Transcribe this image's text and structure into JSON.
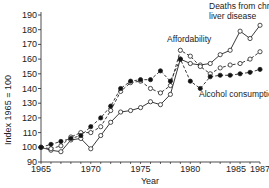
{
  "chart_data": {
    "type": "line",
    "title": "",
    "xlabel": "Year",
    "ylabel": "Index 1965 = 100",
    "xlim": [
      1965,
      1987
    ],
    "ylim": [
      90,
      190
    ],
    "x_ticks": [
      1965,
      1970,
      1975,
      1980,
      1985,
      1987
    ],
    "y_ticks": [
      90,
      100,
      110,
      120,
      130,
      140,
      150,
      160,
      170,
      180,
      190
    ],
    "grid": false,
    "legend_position": "inline annotations",
    "x": [
      1965,
      1966,
      1967,
      1968,
      1969,
      1970,
      1971,
      1972,
      1973,
      1974,
      1975,
      1976,
      1977,
      1978,
      1979,
      1980,
      1981,
      1982,
      1983,
      1984,
      1985,
      1986,
      1987
    ],
    "series": [
      {
        "name": "Deaths from chronic liver disease",
        "marker": "open-circle",
        "line": "solid",
        "values": [
          100,
          98,
          97,
          105,
          106,
          99,
          108,
          117,
          124,
          125,
          127,
          131,
          129,
          136,
          160,
          157,
          156,
          157,
          163,
          166,
          179,
          174,
          183
        ]
      },
      {
        "name": "Affordability",
        "marker": "open-circle",
        "line": "dashed",
        "values": [
          100,
          99,
          101,
          107,
          110,
          110,
          114,
          125,
          138,
          144,
          145,
          140,
          137,
          142,
          166,
          162,
          155,
          150,
          154,
          156,
          157,
          160,
          165
        ]
      },
      {
        "name": "Alcohol consumption",
        "marker": "filled-circle",
        "line": "dashed",
        "values": [
          100,
          102,
          104,
          106,
          108,
          114,
          120,
          128,
          140,
          145,
          146,
          146,
          152,
          145,
          160,
          145,
          140,
          148,
          149,
          149,
          150,
          151,
          153
        ]
      }
    ],
    "annotations": [
      {
        "text": "Deaths from chronic",
        "x": 209,
        "y": 9
      },
      {
        "text": "liver disease",
        "x": 209,
        "y": 19
      },
      {
        "text": "Affordability",
        "x": 167,
        "y": 42
      },
      {
        "text": "Alcohol consumption",
        "x": 199,
        "y": 97
      }
    ]
  }
}
